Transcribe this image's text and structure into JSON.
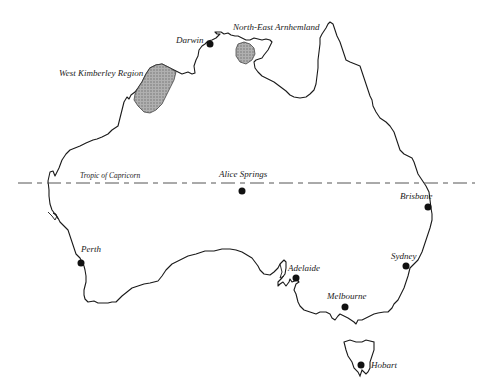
{
  "map": {
    "title": "",
    "colors": {
      "coast": "#1a1a1a",
      "region_fill": "#9a9a9a",
      "city_dot": "#111111",
      "tropic_line": "#555555"
    },
    "tropic": {
      "label": "Tropic of Capricorn"
    },
    "regions": [
      {
        "name": "West Kimberley Region"
      },
      {
        "name": "North-East Arnhemland"
      }
    ],
    "cities": [
      {
        "name": "Darwin"
      },
      {
        "name": "Alice Springs"
      },
      {
        "name": "Brisbane"
      },
      {
        "name": "Perth"
      },
      {
        "name": "Adelaide"
      },
      {
        "name": "Sydney"
      },
      {
        "name": "Melbourne"
      },
      {
        "name": "Hobart"
      }
    ]
  }
}
